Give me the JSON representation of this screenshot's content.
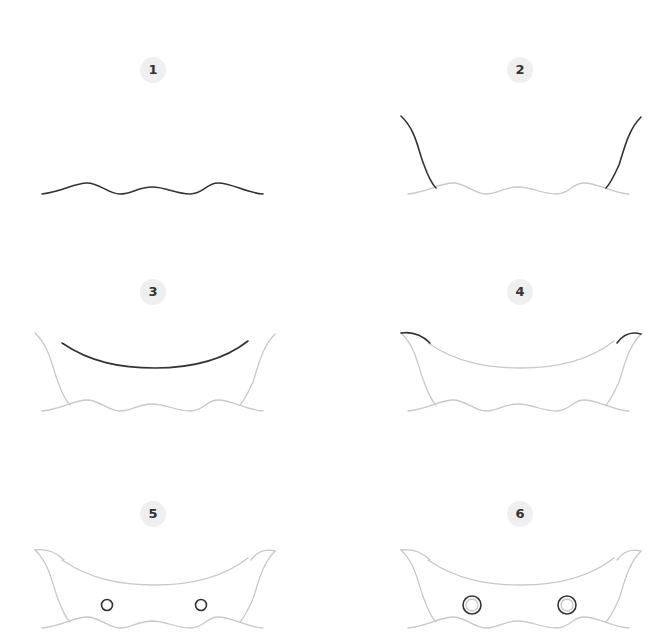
{
  "colors": {
    "ink": "#333333",
    "guide": "#c8c8c8",
    "badge_bg": "#efefef"
  },
  "steps": [
    {
      "number": "1",
      "description": "Draw a wavy water line"
    },
    {
      "number": "2",
      "description": "Draw the two sides of the hull rising from the water"
    },
    {
      "number": "3",
      "description": "Draw the curved top edge of the hull"
    },
    {
      "number": "4",
      "description": "Connect the top edge to the pointed tips"
    },
    {
      "number": "5",
      "description": "Add two small portholes"
    },
    {
      "number": "6",
      "description": "Add inner rings to the portholes"
    }
  ]
}
